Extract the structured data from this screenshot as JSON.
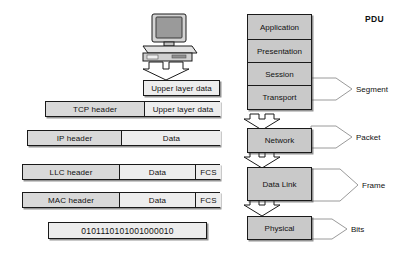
{
  "diagram": {
    "title_pdu": "PDU",
    "device": {
      "name": "computer-workstation"
    }
  },
  "encapsulation": {
    "rows": [
      {
        "name": "upper-layer-data",
        "cells": [
          {
            "label": "Upper layer data",
            "tone": "light"
          }
        ]
      },
      {
        "name": "tcp-segment",
        "cells": [
          {
            "label": "TCP header",
            "tone": "mid"
          },
          {
            "label": "Upper layer data",
            "tone": "light"
          }
        ]
      },
      {
        "name": "ip-packet",
        "cells": [
          {
            "label": "IP header",
            "tone": "mid"
          },
          {
            "label": "Data",
            "tone": "light"
          }
        ]
      },
      {
        "name": "llc-frame",
        "cells": [
          {
            "label": "LLC header",
            "tone": "mid"
          },
          {
            "label": "Data",
            "tone": "light"
          },
          {
            "label": "FCS",
            "tone": "light"
          }
        ]
      },
      {
        "name": "mac-frame",
        "cells": [
          {
            "label": "MAC header",
            "tone": "mid"
          },
          {
            "label": "Data",
            "tone": "light"
          },
          {
            "label": "FCS",
            "tone": "light"
          }
        ]
      },
      {
        "name": "bit-stream",
        "cells": [
          {
            "label": "0101110101001000010",
            "tone": "light"
          }
        ]
      }
    ]
  },
  "osi_stack": {
    "upper_group": [
      {
        "label": "Application"
      },
      {
        "label": "Presentation"
      },
      {
        "label": "Session"
      },
      {
        "label": "Transport"
      }
    ],
    "lower_layers": [
      {
        "label": "Network"
      },
      {
        "label": "Data Link"
      },
      {
        "label": "Physical"
      }
    ]
  },
  "pdu_callouts": [
    {
      "label": "Segment"
    },
    {
      "label": "Packet"
    },
    {
      "label": "Frame"
    },
    {
      "label": "Bits"
    }
  ],
  "colors": {
    "box_fill_dark": "#d9d9d9",
    "box_fill_light": "#ededed",
    "layer_fill": "#c9c9c9",
    "stroke": "#1a1a1a",
    "background": "#ffffff"
  }
}
